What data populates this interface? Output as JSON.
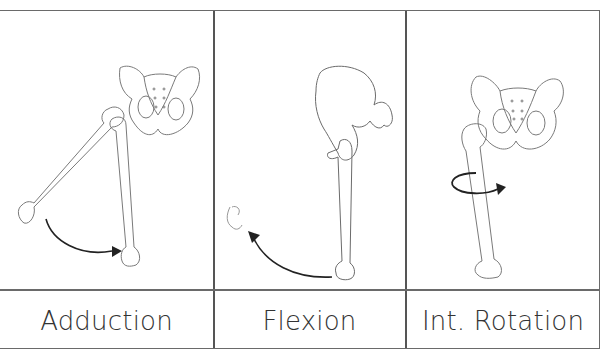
{
  "figure": {
    "panels": [
      {
        "id": "adduction",
        "label": "Adduction",
        "motion": "femur swings from abducted position toward midline",
        "arrow": "curved-arrow-right"
      },
      {
        "id": "flexion",
        "label": "Flexion",
        "motion": "femur swings forward/upward (lateral view)",
        "arrow": "curved-arrow-up-left"
      },
      {
        "id": "int-rotation",
        "label": "Int. Rotation",
        "motion": "femur rotates internally about its long axis",
        "arrow": "circular-arrow"
      }
    ],
    "colors": {
      "line": "#555555",
      "bone_stroke": "#6b6b6b",
      "arrow": "#222222",
      "text": "#333333"
    }
  }
}
